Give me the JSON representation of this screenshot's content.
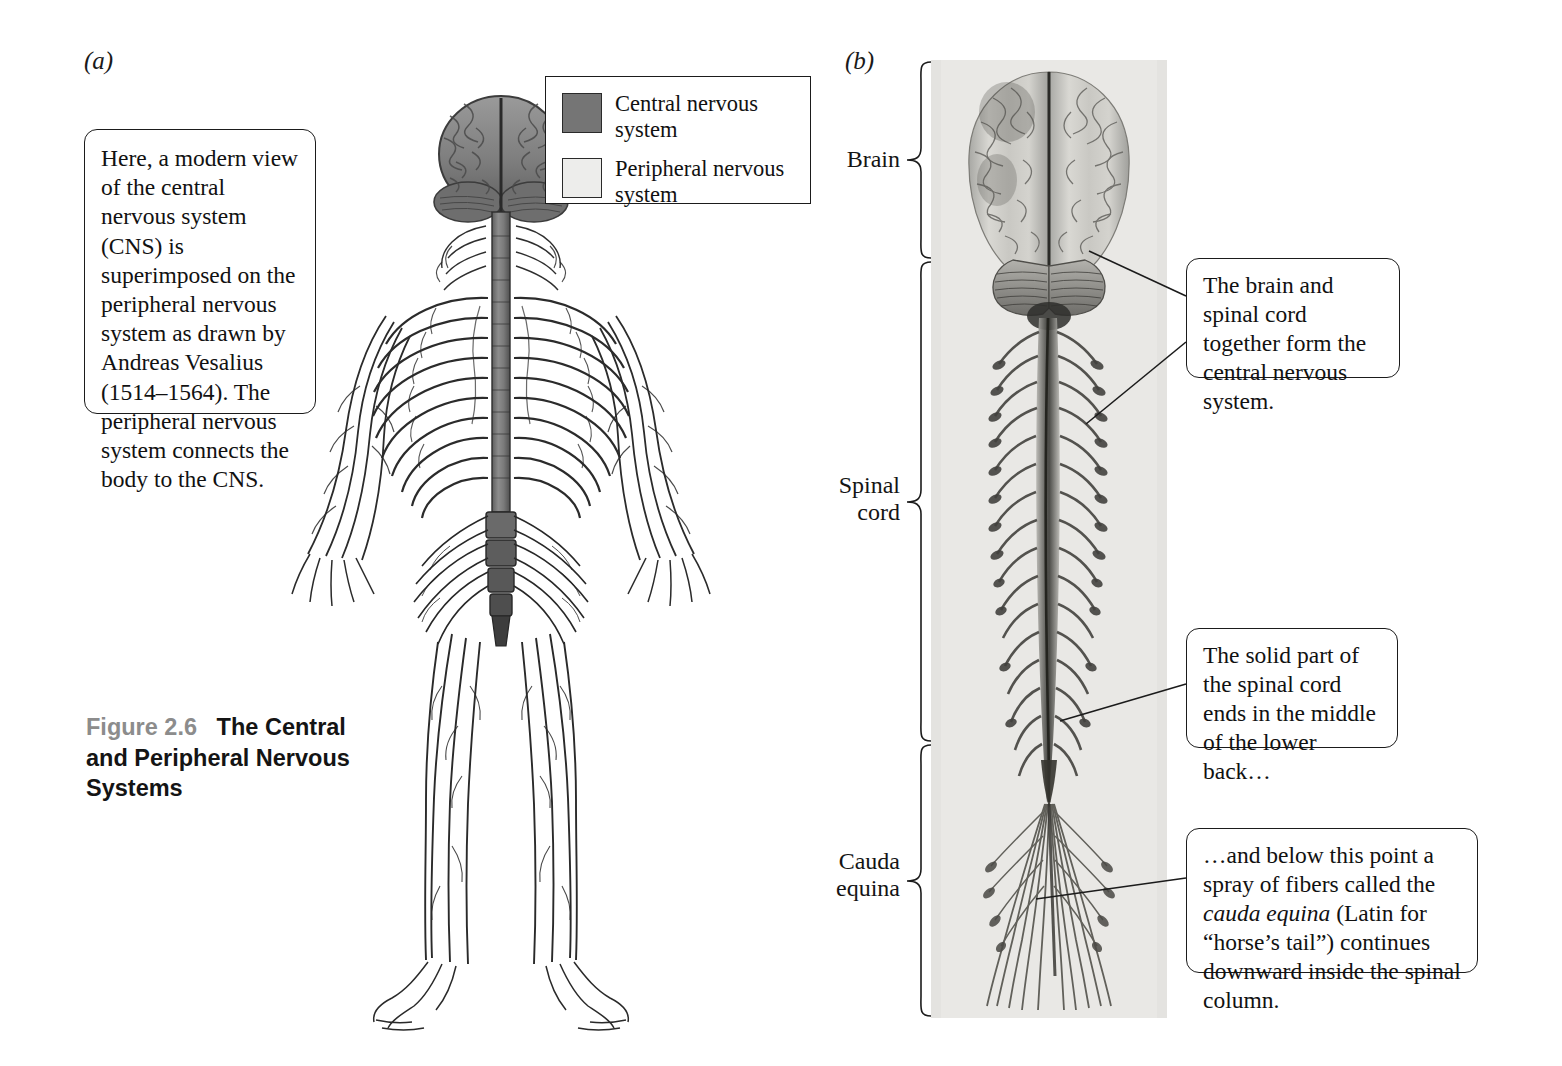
{
  "figure": {
    "number": "Figure 2.6",
    "title": "The Central and Peripheral Nervous Systems",
    "panel_a_letter": "(a)",
    "panel_b_letter": "(b)"
  },
  "intro_callout": {
    "text": "Here, a modern view of the central nervous system (CNS) is superimposed on the peripheral nervous system as drawn by Andreas Vesalius (1514–1564). The peripheral nervous system connects the body to the CNS."
  },
  "legend": {
    "items": [
      {
        "label": "Central nervous system",
        "color": "#757575",
        "name": "cns-swatch"
      },
      {
        "label": "Peripheral nervous system",
        "color": "#ededeb",
        "name": "pns-swatch"
      }
    ]
  },
  "panel_b": {
    "brackets": [
      {
        "label": "Brain",
        "name": "bracket-brain"
      },
      {
        "label": "Spinal\ncord",
        "label_line1": "Spinal",
        "label_line2": "cord",
        "name": "bracket-spinal-cord"
      },
      {
        "label": "Cauda\nequina",
        "label_line1": "Cauda",
        "label_line2": "equina",
        "name": "bracket-cauda-equina"
      }
    ],
    "callouts": [
      {
        "name": "callout-cns",
        "text": "The brain and spinal cord together form the central nervous system."
      },
      {
        "name": "callout-spinal-cord-end",
        "text": "The solid part of the spinal cord ends in the middle of the lower back…"
      },
      {
        "name": "callout-cauda-equina",
        "text_part1": "…and below this point a spray of fibers called the ",
        "text_italic": "cauda equina",
        "text_part2": " (Latin for “horse’s tail”) continues downward inside the spinal column."
      }
    ]
  },
  "colors": {
    "cns_gray": "#757575",
    "pns_light": "#ededeb",
    "photo_background": "#e9e8e5",
    "ink": "#1b1b1b",
    "caption_gray": "#8c8c8c"
  }
}
